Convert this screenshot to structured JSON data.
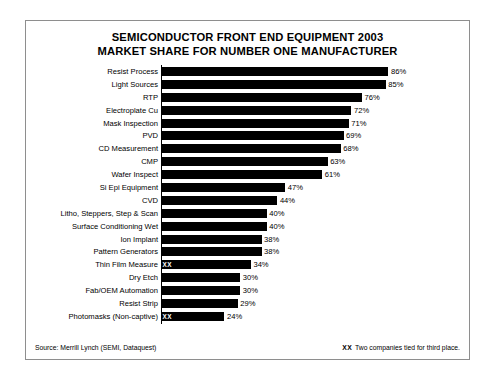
{
  "chart_data": {
    "type": "bar",
    "orientation": "horizontal",
    "title": "SEMICONDUCTOR FRONT END EQUIPMENT 2003 MARKET SHARE FOR NUMBER ONE MANUFACTURER",
    "title_lines": [
      "SEMICONDUCTOR FRONT END EQUIPMENT 2003",
      "MARKET SHARE FOR NUMBER ONE MANUFACTURER"
    ],
    "xlabel": "",
    "ylabel": "",
    "xlim": [
      0,
      86
    ],
    "grid": false,
    "legend": null,
    "value_suffix": "%",
    "bar_color": "#000000",
    "categories": [
      "Resist Process",
      "Light Sources",
      "RTP",
      "Electroplate Cu",
      "Mask Inspection",
      "PVD",
      "CD Measurement",
      "CMP",
      "Wafer Inspect",
      "Si Epi Equipment",
      "CVD",
      "Litho, Steppers, Step & Scan",
      "Surface Conditioning Wet",
      "Ion Implant",
      "Pattern Generators",
      "Thin Film Measure",
      "Dry Etch",
      "Fab/OEM Automation",
      "Resist Strip",
      "Photomasks (Non-captive)"
    ],
    "values": [
      86,
      85,
      76,
      72,
      71,
      69,
      68,
      63,
      61,
      47,
      44,
      40,
      40,
      38,
      38,
      34,
      30,
      30,
      29,
      24
    ],
    "value_labels": [
      "86%",
      "85%",
      "76%",
      "72%",
      "71%",
      "69%",
      "68%",
      "63%",
      "61%",
      "47%",
      "44%",
      "40%",
      "40%",
      "38%",
      "38%",
      "34%",
      "30%",
      "30%",
      "29%",
      "24%"
    ],
    "tie_marker": "XX",
    "tie_rows": [
      15,
      19
    ],
    "annotations": [
      {
        "marker": "XX",
        "text": "Two companies tied for third place."
      }
    ]
  },
  "footer": {
    "source": "Source: Merrill Lynch (SEMI, Dataquest)",
    "note_marker": "XX",
    "note_text": "Two companies tied for third place."
  }
}
